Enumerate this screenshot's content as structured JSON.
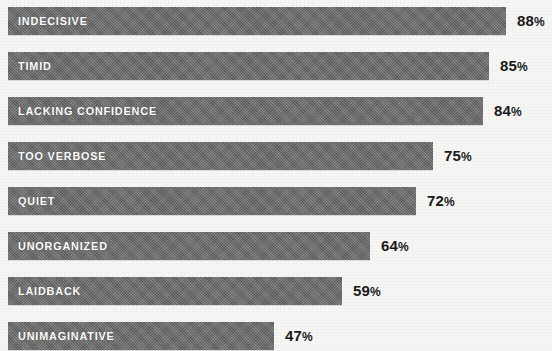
{
  "chart_data": {
    "type": "bar",
    "orientation": "horizontal",
    "title": "",
    "subtitle": "",
    "xlabel": "",
    "ylabel": "",
    "xlim": [
      0,
      100
    ],
    "grid": false,
    "legend": null,
    "value_suffix": "%",
    "categories": [
      "INDECISIVE",
      "TIMID",
      "LACKING CONFIDENCE",
      "TOO VERBOSE",
      "QUIET",
      "UNORGANIZED",
      "LAIDBACK",
      "UNIMAGINATIVE"
    ],
    "values": [
      88,
      85,
      84,
      75,
      72,
      64,
      59,
      47
    ],
    "value_labels": [
      "88%",
      "85%",
      "84%",
      "75%",
      "72%",
      "64%",
      "59%",
      "47%"
    ],
    "colors": {
      "bar_fill": "#6e6e6e",
      "bar_label_text": "#ffffff",
      "value_label_text": "#1a1a1a",
      "background": "#f6f6f4"
    }
  },
  "bars": [
    {
      "label": "INDECISIVE",
      "value": 88,
      "value_label": "88",
      "suffix": "%"
    },
    {
      "label": "TIMID",
      "value": 85,
      "value_label": "85",
      "suffix": "%"
    },
    {
      "label": "LACKING CONFIDENCE",
      "value": 84,
      "value_label": "84",
      "suffix": "%"
    },
    {
      "label": "TOO VERBOSE",
      "value": 75,
      "value_label": "75",
      "suffix": "%"
    },
    {
      "label": "QUIET",
      "value": 72,
      "value_label": "72",
      "suffix": "%"
    },
    {
      "label": "UNORGANIZED",
      "value": 64,
      "value_label": "64",
      "suffix": "%"
    },
    {
      "label": "LAIDBACK",
      "value": 59,
      "value_label": "59",
      "suffix": "%"
    },
    {
      "label": "UNIMAGINATIVE",
      "value": 47,
      "value_label": "47",
      "suffix": "%"
    }
  ],
  "layout": {
    "bar_left_px": 8,
    "bar_height_px": 28,
    "row_pitch_px": 45,
    "first_row_top_px": 7,
    "px_per_percent": 5.66,
    "value_gap_px": 11
  }
}
